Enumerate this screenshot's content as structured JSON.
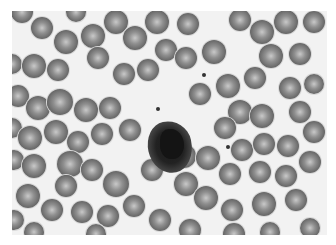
{
  "image": {
    "description": "Grayscale light micrograph of a blood smear: many red blood cells surrounding a single dark-stained white blood cell (neutrophil) near center",
    "subject": "blood smear",
    "cells": [
      {
        "x": 22,
        "y": 12,
        "r": 11
      },
      {
        "x": 42,
        "y": 28,
        "r": 11
      },
      {
        "x": 66,
        "y": 42,
        "r": 12
      },
      {
        "x": 93,
        "y": 36,
        "r": 12
      },
      {
        "x": 76,
        "y": 12,
        "r": 10
      },
      {
        "x": 116,
        "y": 22,
        "r": 12
      },
      {
        "x": 135,
        "y": 38,
        "r": 12
      },
      {
        "x": 157,
        "y": 22,
        "r": 12
      },
      {
        "x": 166,
        "y": 50,
        "r": 11
      },
      {
        "x": 188,
        "y": 24,
        "r": 11
      },
      {
        "x": 186,
        "y": 58,
        "r": 11
      },
      {
        "x": 214,
        "y": 52,
        "r": 12
      },
      {
        "x": 240,
        "y": 20,
        "r": 11
      },
      {
        "x": 262,
        "y": 32,
        "r": 12
      },
      {
        "x": 286,
        "y": 22,
        "r": 12
      },
      {
        "x": 314,
        "y": 22,
        "r": 11
      },
      {
        "x": 271,
        "y": 56,
        "r": 12
      },
      {
        "x": 300,
        "y": 54,
        "r": 11
      },
      {
        "x": 12,
        "y": 64,
        "r": 10
      },
      {
        "x": 34,
        "y": 66,
        "r": 12
      },
      {
        "x": 58,
        "y": 70,
        "r": 11
      },
      {
        "x": 98,
        "y": 58,
        "r": 11
      },
      {
        "x": 124,
        "y": 74,
        "r": 11
      },
      {
        "x": 148,
        "y": 70,
        "r": 11
      },
      {
        "x": 18,
        "y": 96,
        "r": 11
      },
      {
        "x": 38,
        "y": 108,
        "r": 12
      },
      {
        "x": 60,
        "y": 102,
        "r": 13
      },
      {
        "x": 86,
        "y": 110,
        "r": 12
      },
      {
        "x": 110,
        "y": 108,
        "r": 11
      },
      {
        "x": 200,
        "y": 94,
        "r": 11
      },
      {
        "x": 228,
        "y": 86,
        "r": 12
      },
      {
        "x": 255,
        "y": 78,
        "r": 11
      },
      {
        "x": 290,
        "y": 88,
        "r": 11
      },
      {
        "x": 314,
        "y": 84,
        "r": 10
      },
      {
        "x": 240,
        "y": 112,
        "r": 12
      },
      {
        "x": 262,
        "y": 116,
        "r": 12
      },
      {
        "x": 300,
        "y": 112,
        "r": 11
      },
      {
        "x": 225,
        "y": 128,
        "r": 11
      },
      {
        "x": 12,
        "y": 128,
        "r": 10
      },
      {
        "x": 30,
        "y": 138,
        "r": 12
      },
      {
        "x": 56,
        "y": 132,
        "r": 12
      },
      {
        "x": 78,
        "y": 142,
        "r": 11
      },
      {
        "x": 102,
        "y": 134,
        "r": 11
      },
      {
        "x": 130,
        "y": 130,
        "r": 11
      },
      {
        "x": 152,
        "y": 170,
        "r": 11
      },
      {
        "x": 184,
        "y": 156,
        "r": 12
      },
      {
        "x": 208,
        "y": 158,
        "r": 12
      },
      {
        "x": 242,
        "y": 150,
        "r": 11
      },
      {
        "x": 264,
        "y": 144,
        "r": 11
      },
      {
        "x": 288,
        "y": 146,
        "r": 11
      },
      {
        "x": 314,
        "y": 132,
        "r": 11
      },
      {
        "x": 310,
        "y": 162,
        "r": 11
      },
      {
        "x": 14,
        "y": 160,
        "r": 10
      },
      {
        "x": 34,
        "y": 166,
        "r": 12
      },
      {
        "x": 70,
        "y": 164,
        "r": 13
      },
      {
        "x": 92,
        "y": 170,
        "r": 11
      },
      {
        "x": 116,
        "y": 184,
        "r": 13
      },
      {
        "x": 66,
        "y": 186,
        "r": 11
      },
      {
        "x": 230,
        "y": 174,
        "r": 11
      },
      {
        "x": 260,
        "y": 172,
        "r": 11
      },
      {
        "x": 286,
        "y": 176,
        "r": 11
      },
      {
        "x": 186,
        "y": 184,
        "r": 12
      },
      {
        "x": 206,
        "y": 198,
        "r": 12
      },
      {
        "x": 134,
        "y": 206,
        "r": 11
      },
      {
        "x": 28,
        "y": 196,
        "r": 12
      },
      {
        "x": 14,
        "y": 220,
        "r": 10
      },
      {
        "x": 52,
        "y": 210,
        "r": 11
      },
      {
        "x": 82,
        "y": 212,
        "r": 11
      },
      {
        "x": 108,
        "y": 216,
        "r": 11
      },
      {
        "x": 160,
        "y": 220,
        "r": 11
      },
      {
        "x": 232,
        "y": 210,
        "r": 11
      },
      {
        "x": 264,
        "y": 204,
        "r": 12
      },
      {
        "x": 296,
        "y": 200,
        "r": 11
      },
      {
        "x": 234,
        "y": 234,
        "r": 11
      },
      {
        "x": 190,
        "y": 230,
        "r": 11
      },
      {
        "x": 310,
        "y": 228,
        "r": 10
      },
      {
        "x": 34,
        "y": 232,
        "r": 10
      },
      {
        "x": 96,
        "y": 234,
        "r": 10
      },
      {
        "x": 270,
        "y": 232,
        "r": 10
      }
    ],
    "wbc_label": "neutrophil",
    "specks": [
      {
        "x": 204,
        "y": 75
      },
      {
        "x": 228,
        "y": 147
      },
      {
        "x": 158,
        "y": 109
      }
    ]
  }
}
